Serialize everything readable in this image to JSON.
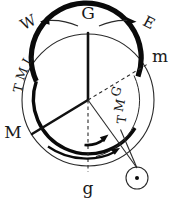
{
  "figure": {
    "type": "celestial-clock-diagram"
  },
  "labels": {
    "top_center": "G",
    "top_left": "W",
    "top_right": "E",
    "left": "M",
    "right": "m",
    "bottom": "g",
    "arc_outer": "LMT",
    "arc_inner": "GMT"
  },
  "letters": {
    "lmt": [
      "L",
      "M",
      "T"
    ],
    "gmt": [
      "G",
      "M",
      "T"
    ]
  },
  "symbols": {
    "sun": "sun-symbol"
  },
  "colors": {
    "ink": "#0a0a0a",
    "thin_ink": "#2a2a2a",
    "background": "#ffffff"
  },
  "geometry": {
    "center_x": 88,
    "center_y": 100,
    "outer_radius": 66,
    "inner_radius": 55,
    "sun_x": 137,
    "sun_y": 178,
    "sun_radius": 11
  }
}
